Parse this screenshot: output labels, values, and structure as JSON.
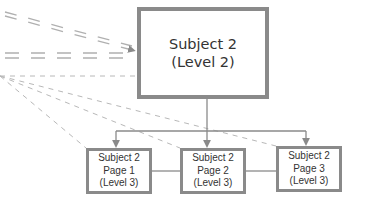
{
  "diagram": {
    "main_node": {
      "line1": "Subject 2",
      "line2": "(Level 2)"
    },
    "child_nodes": [
      {
        "line1": "Subject 2",
        "line2": "Page 1",
        "line3": "(Level 3)"
      },
      {
        "line1": "Subject 2",
        "line2": "Page 2",
        "line3": "(Level 3)"
      },
      {
        "line1": "Subject 2",
        "line2": "Page 3",
        "line3": "(Level 3)"
      }
    ],
    "colors": {
      "border": "#8a8a8a",
      "connector": "#8a8a8a",
      "dashed": "#b0b0b0",
      "text": "#333333"
    }
  }
}
